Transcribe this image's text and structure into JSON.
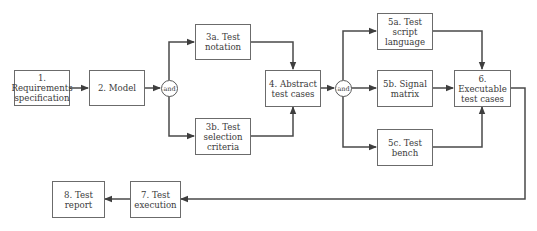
{
  "diagram": {
    "type": "flowchart",
    "colors": {
      "line": "#4a4a4a",
      "box_border": "#6b6b6b",
      "text": "#3a3a3a",
      "background": "#ffffff"
    },
    "nodes": {
      "n1": {
        "label": "1.\nRequirements\nspecification"
      },
      "n2": {
        "label": "2. Model"
      },
      "and1": {
        "label": "and"
      },
      "n3a": {
        "label": "3a. Test\nnotation"
      },
      "n3b": {
        "label": "3b. Test\nselection\ncriteria"
      },
      "n4": {
        "label": "4. Abstract\ntest cases"
      },
      "and2": {
        "label": "and"
      },
      "n5a": {
        "label": "5a. Test script\nlanguage"
      },
      "n5b": {
        "label": "5b. Signal\nmatrix"
      },
      "n5c": {
        "label": "5c. Test\nbench"
      },
      "n6": {
        "label": "6. Executable\ntest cases"
      },
      "n7": {
        "label": "7. Test\nexecution"
      },
      "n8": {
        "label": "8. Test\nreport"
      }
    },
    "edges": [
      {
        "from": "1. Requirements specification",
        "to": "2. Model"
      },
      {
        "from": "2. Model",
        "to": "and"
      },
      {
        "from": "and",
        "to": "3a. Test notation"
      },
      {
        "from": "and",
        "to": "3b. Test selection criteria"
      },
      {
        "from": "3a. Test notation",
        "to": "4. Abstract test cases"
      },
      {
        "from": "3b. Test selection criteria",
        "to": "4. Abstract test cases"
      },
      {
        "from": "4. Abstract test cases",
        "to": "and"
      },
      {
        "from": "and",
        "to": "5a. Test script language"
      },
      {
        "from": "and",
        "to": "5b. Signal matrix"
      },
      {
        "from": "and",
        "to": "5c. Test bench"
      },
      {
        "from": "5a. Test script language",
        "to": "6. Executable test cases"
      },
      {
        "from": "5b. Signal matrix",
        "to": "6. Executable test cases"
      },
      {
        "from": "5c. Test bench",
        "to": "6. Executable test cases"
      },
      {
        "from": "6. Executable test cases",
        "to": "7. Test execution"
      },
      {
        "from": "7. Test execution",
        "to": "8. Test report"
      }
    ]
  }
}
